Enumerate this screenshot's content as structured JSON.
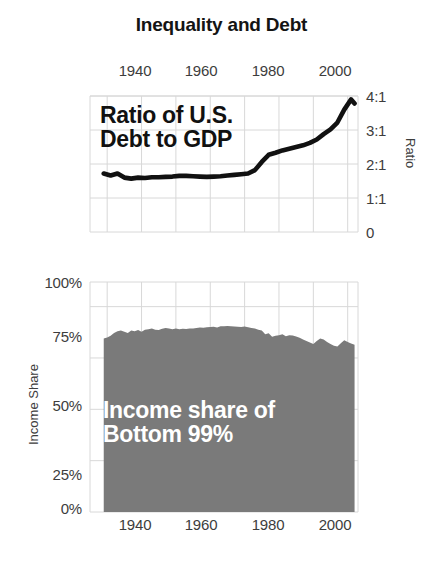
{
  "figure": {
    "title": "Inequality and Debt",
    "width": 443,
    "height": 573,
    "background": "#ffffff"
  },
  "colors": {
    "line": "#111111",
    "area_fill": "#7a7a7a",
    "grid": "#d8d8d8",
    "axis_text": "#3d3d3d",
    "title_text": "#141414",
    "annotation_light": "#ffffff",
    "annotation_dark": "#111111"
  },
  "chart_data": [
    {
      "type": "line",
      "title": "Ratio of U.S. Debt to GDP",
      "annotation": "Ratio of U.S.\nDebt to GDP",
      "xlabel": "",
      "ylabel": "Ratio",
      "xlim": [
        1935,
        2013
      ],
      "ylim": [
        0,
        4
      ],
      "xticks": [
        1940,
        1960,
        1980,
        2000
      ],
      "xticklabels": [
        "1940",
        "1960",
        "1980",
        "2000"
      ],
      "yticks": [
        0,
        1,
        2,
        3,
        4
      ],
      "yticklabels": [
        "0",
        "1:1",
        "2:1",
        "3:1",
        "4:1"
      ],
      "grid": true,
      "legend": "none",
      "x": [
        1939,
        1941,
        1943,
        1945,
        1947,
        1949,
        1951,
        1953,
        1955,
        1957,
        1959,
        1961,
        1963,
        1965,
        1967,
        1969,
        1971,
        1973,
        1975,
        1977,
        1979,
        1981,
        1983,
        1985,
        1987,
        1989,
        1991,
        1993,
        1995,
        1997,
        1999,
        2001,
        2003,
        2005,
        2007,
        2009,
        2011,
        2012
      ],
      "values": [
        1.72,
        1.66,
        1.72,
        1.6,
        1.57,
        1.6,
        1.59,
        1.61,
        1.61,
        1.62,
        1.63,
        1.65,
        1.65,
        1.64,
        1.63,
        1.62,
        1.63,
        1.64,
        1.66,
        1.68,
        1.7,
        1.72,
        1.82,
        2.06,
        2.27,
        2.33,
        2.4,
        2.45,
        2.5,
        2.55,
        2.62,
        2.72,
        2.88,
        3.02,
        3.22,
        3.6,
        3.9,
        3.78
      ]
    },
    {
      "type": "area",
      "title": "Income share of Bottom 99%",
      "annotation": "Income share of\nBottom 99%",
      "xlabel": "",
      "ylabel": "Income Share",
      "xlim": [
        1935,
        2013
      ],
      "ylim": [
        0,
        1.12
      ],
      "xticks": [
        1940,
        1960,
        1980,
        2000
      ],
      "xticklabels": [
        "1940",
        "1960",
        "1980",
        "2000"
      ],
      "yticks": [
        0,
        0.25,
        0.5,
        0.75,
        1.0
      ],
      "yticklabels": [
        "0%",
        "25%",
        "50%",
        "75%",
        "100%"
      ],
      "grid": true,
      "legend": "none",
      "x": [
        1939,
        1940,
        1941,
        1942,
        1943,
        1944,
        1945,
        1946,
        1947,
        1948,
        1949,
        1950,
        1951,
        1952,
        1953,
        1954,
        1955,
        1956,
        1957,
        1958,
        1959,
        1960,
        1961,
        1962,
        1963,
        1964,
        1965,
        1966,
        1967,
        1968,
        1969,
        1970,
        1971,
        1972,
        1973,
        1974,
        1975,
        1976,
        1977,
        1978,
        1979,
        1980,
        1981,
        1982,
        1983,
        1984,
        1985,
        1986,
        1987,
        1988,
        1989,
        1990,
        1991,
        1992,
        1993,
        1994,
        1995,
        1996,
        1997,
        1998,
        1999,
        2000,
        2001,
        2002,
        2003,
        2004,
        2005,
        2006,
        2007,
        2008,
        2009,
        2010,
        2011,
        2012
      ],
      "values": [
        0.845,
        0.85,
        0.858,
        0.872,
        0.88,
        0.884,
        0.878,
        0.872,
        0.884,
        0.88,
        0.886,
        0.878,
        0.888,
        0.89,
        0.894,
        0.888,
        0.886,
        0.892,
        0.896,
        0.894,
        0.89,
        0.893,
        0.89,
        0.892,
        0.891,
        0.894,
        0.893,
        0.896,
        0.898,
        0.897,
        0.9,
        0.901,
        0.902,
        0.899,
        0.904,
        0.905,
        0.906,
        0.904,
        0.903,
        0.902,
        0.901,
        0.903,
        0.9,
        0.896,
        0.893,
        0.888,
        0.884,
        0.866,
        0.87,
        0.854,
        0.858,
        0.861,
        0.866,
        0.856,
        0.861,
        0.86,
        0.855,
        0.848,
        0.84,
        0.833,
        0.826,
        0.818,
        0.833,
        0.845,
        0.84,
        0.828,
        0.818,
        0.81,
        0.806,
        0.822,
        0.836,
        0.828,
        0.82,
        0.815
      ]
    }
  ]
}
